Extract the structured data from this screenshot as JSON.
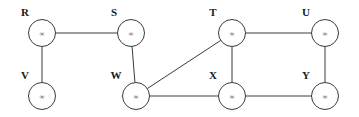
{
  "figure": {
    "background_color": "#ffffff",
    "stroke_color": "#3a3a3a",
    "label_color": "#1a1a1a",
    "node_fill": "#ffffff",
    "node_radius": 13.5,
    "width": 359,
    "height": 117
  },
  "chart_data": {
    "type": "diagram",
    "subtype": "node-link-graph",
    "directed": false,
    "title": "",
    "node_value_symbol": "∞",
    "nodes": [
      {
        "id": "R",
        "label": "R",
        "value": "∞",
        "x": 42,
        "y": 33,
        "label_x": 25,
        "label_y": 16
      },
      {
        "id": "S",
        "label": "S",
        "value": "∞",
        "x": 131,
        "y": 33,
        "label_x": 114,
        "label_y": 16
      },
      {
        "id": "T",
        "label": "T",
        "value": "∞",
        "x": 232,
        "y": 33,
        "label_x": 213,
        "label_y": 16
      },
      {
        "id": "U",
        "label": "U",
        "value": "∞",
        "x": 325,
        "y": 33,
        "label_x": 306,
        "label_y": 16
      },
      {
        "id": "V",
        "label": "V",
        "value": "∞",
        "x": 42,
        "y": 96,
        "label_x": 25,
        "label_y": 79
      },
      {
        "id": "W",
        "label": "W",
        "value": "∞",
        "x": 136,
        "y": 96,
        "label_x": 116,
        "label_y": 79
      },
      {
        "id": "X",
        "label": "X",
        "value": "∞",
        "x": 232,
        "y": 96,
        "label_x": 213,
        "label_y": 79
      },
      {
        "id": "Y",
        "label": "Y",
        "value": "∞",
        "x": 325,
        "y": 96,
        "label_x": 306,
        "label_y": 79
      }
    ],
    "edges": [
      {
        "source": "R",
        "target": "S",
        "weight": ""
      },
      {
        "source": "R",
        "target": "V",
        "weight": ""
      },
      {
        "source": "S",
        "target": "W",
        "weight": ""
      },
      {
        "source": "T",
        "target": "W",
        "weight": ""
      },
      {
        "source": "T",
        "target": "U",
        "weight": ""
      },
      {
        "source": "T",
        "target": "X",
        "weight": ""
      },
      {
        "source": "W",
        "target": "X",
        "weight": ""
      },
      {
        "source": "U",
        "target": "Y",
        "weight": ""
      },
      {
        "source": "X",
        "target": "Y",
        "weight": ""
      }
    ]
  }
}
